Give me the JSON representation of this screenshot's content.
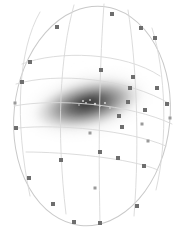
{
  "figure": {
    "name": "galaxy-grid-overlay",
    "width": 184,
    "height": 233,
    "background_color": "#ffffff"
  },
  "colors": {
    "background": "#ffffff",
    "grid_line": "#d8d8d8",
    "grid_line_faint": "#e6e6e6",
    "outline": "#c9c9c9",
    "node_fill": "#6e6e6e",
    "node_fill_light": "#9a9a9a",
    "galaxy_core": "#3a3a3a",
    "galaxy_mid": "#8a8a8a",
    "galaxy_halo": "#e2e2e2",
    "core_highlight": "#b8b8b8"
  },
  "outline": {
    "name": "bounding-ellipse",
    "cx": 92,
    "cy": 116,
    "rx": 78,
    "ry": 110,
    "rotation_deg": 6
  },
  "galaxy": {
    "name": "galaxy-blob",
    "cx": 88,
    "cy": 104,
    "rx": 68,
    "ry": 30,
    "rotation_deg": -13,
    "core_rx": 16,
    "core_ry": 7,
    "peak_gray": "#3a3a3a"
  },
  "core_speckles": [
    {
      "x": 83,
      "y": 101,
      "r": 1.1,
      "color": "#c8c8c8"
    },
    {
      "x": 86,
      "y": 103,
      "r": 0.9,
      "color": "#d4d4d4"
    },
    {
      "x": 90,
      "y": 100,
      "r": 1.0,
      "color": "#bdbdbd"
    },
    {
      "x": 95,
      "y": 104,
      "r": 1.2,
      "color": "#cfcfcf"
    },
    {
      "x": 100,
      "y": 106,
      "r": 0.8,
      "color": "#d8d8d8"
    },
    {
      "x": 105,
      "y": 103,
      "r": 0.9,
      "color": "#e0e0e0"
    },
    {
      "x": 79,
      "y": 105,
      "r": 0.8,
      "color": "#d0d0d0"
    },
    {
      "x": 110,
      "y": 108,
      "r": 0.8,
      "color": "#e4e4e4"
    }
  ],
  "meridians": [
    {
      "id": "m1",
      "label": "meridian-1",
      "path": "M 40 12 C 18 50, 14 120, 30 196"
    },
    {
      "id": "m2",
      "label": "meridian-2",
      "path": "M 74 5 C 60 55, 56 130, 66 214"
    },
    {
      "id": "m3",
      "label": "meridian-3",
      "path": "M 104 4 C 100 58, 98 136, 100 222"
    },
    {
      "id": "m4",
      "label": "meridian-4",
      "path": "M 128 10 C 136 60, 140 140, 134 216"
    },
    {
      "id": "m5",
      "label": "meridian-5",
      "path": "M 152 28 C 166 72, 168 140, 156 190"
    }
  ],
  "parallels": [
    {
      "id": "p1",
      "label": "parallel-1",
      "path": "M 22 64 C 58 50, 124 52, 160 76"
    },
    {
      "id": "p2",
      "label": "parallel-2",
      "path": "M 16 84 C 56 72, 128 78, 170 104"
    },
    {
      "id": "p3",
      "label": "parallel-3",
      "path": "M 14 106 C 56 98, 130 104, 172 124"
    },
    {
      "id": "p4",
      "label": "parallel-4",
      "path": "M 18 128 C 58 124, 128 130, 166 146"
    },
    {
      "id": "p5",
      "label": "parallel-5",
      "path": "M 26 152 C 64 152, 130 158, 158 170"
    }
  ],
  "nodes": [
    {
      "x": 57,
      "y": 27,
      "size": 4,
      "tone": "dark"
    },
    {
      "x": 112,
      "y": 14,
      "size": 4,
      "tone": "dark"
    },
    {
      "x": 141,
      "y": 28,
      "size": 4,
      "tone": "dark"
    },
    {
      "x": 155,
      "y": 38,
      "size": 4,
      "tone": "dark"
    },
    {
      "x": 30,
      "y": 62,
      "size": 4,
      "tone": "dark"
    },
    {
      "x": 101,
      "y": 70,
      "size": 4,
      "tone": "dark"
    },
    {
      "x": 133,
      "y": 77,
      "size": 4,
      "tone": "dark"
    },
    {
      "x": 157,
      "y": 88,
      "size": 4,
      "tone": "dark"
    },
    {
      "x": 22,
      "y": 82,
      "size": 4,
      "tone": "dark"
    },
    {
      "x": 130,
      "y": 88,
      "size": 4,
      "tone": "dark"
    },
    {
      "x": 167,
      "y": 104,
      "size": 4,
      "tone": "dark"
    },
    {
      "x": 15,
      "y": 103,
      "size": 3,
      "tone": "light"
    },
    {
      "x": 128,
      "y": 102,
      "size": 4,
      "tone": "dark"
    },
    {
      "x": 145,
      "y": 110,
      "size": 4,
      "tone": "dark"
    },
    {
      "x": 170,
      "y": 118,
      "size": 3,
      "tone": "light"
    },
    {
      "x": 119,
      "y": 116,
      "size": 4,
      "tone": "dark"
    },
    {
      "x": 142,
      "y": 124,
      "size": 3,
      "tone": "light"
    },
    {
      "x": 16,
      "y": 128,
      "size": 4,
      "tone": "dark"
    },
    {
      "x": 122,
      "y": 127,
      "size": 4,
      "tone": "dark"
    },
    {
      "x": 148,
      "y": 141,
      "size": 3,
      "tone": "light"
    },
    {
      "x": 90,
      "y": 133,
      "size": 3,
      "tone": "light"
    },
    {
      "x": 61,
      "y": 160,
      "size": 4,
      "tone": "dark"
    },
    {
      "x": 100,
      "y": 152,
      "size": 4,
      "tone": "dark"
    },
    {
      "x": 118,
      "y": 158,
      "size": 4,
      "tone": "dark"
    },
    {
      "x": 144,
      "y": 166,
      "size": 4,
      "tone": "dark"
    },
    {
      "x": 29,
      "y": 178,
      "size": 4,
      "tone": "dark"
    },
    {
      "x": 95,
      "y": 188,
      "size": 3,
      "tone": "light"
    },
    {
      "x": 137,
      "y": 206,
      "size": 4,
      "tone": "dark"
    },
    {
      "x": 53,
      "y": 204,
      "size": 4,
      "tone": "dark"
    },
    {
      "x": 74,
      "y": 222,
      "size": 4,
      "tone": "dark"
    },
    {
      "x": 100,
      "y": 223,
      "size": 4,
      "tone": "dark"
    }
  ]
}
